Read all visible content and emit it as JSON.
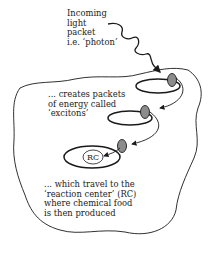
{
  "diagram": {
    "photon_label": [
      "Incoming",
      "light",
      "packet",
      "i.e. ‘photon’"
    ],
    "exciton_label": [
      "... creates packets",
      "of energy called",
      "‘excitons’"
    ],
    "rc_label": [
      "... which travel to the",
      "‘reaction center’ (RC)",
      "where chemical food",
      "is then produced"
    ],
    "rc_text": "RC",
    "colors": {
      "line": "#1a1a1a",
      "exciton_fill": "#8c8c8c",
      "background": "#ffffff"
    }
  }
}
